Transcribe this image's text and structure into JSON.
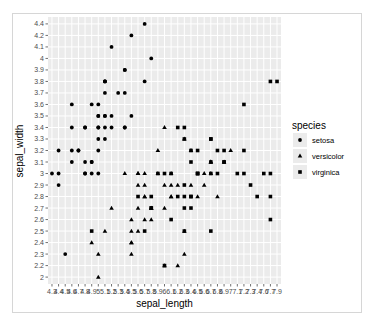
{
  "chart_data": {
    "type": "scatter",
    "title": "",
    "xlabel": "sepal_length",
    "ylabel": "sepal_width",
    "x_scale": "discrete",
    "y_scale": "discrete",
    "x_levels": [
      "4.3",
      "4.4",
      "4.5",
      "4.6",
      "4.7",
      "4.8",
      "4.9",
      "5",
      "5.1",
      "5.2",
      "5.3",
      "5.4",
      "5.5",
      "5.6",
      "5.7",
      "5.8",
      "5.9",
      "6",
      "6.1",
      "6.2",
      "6.3",
      "6.4",
      "6.5",
      "6.6",
      "6.7",
      "6.8",
      "6.9",
      "7",
      "7.1",
      "7.2",
      "7.3",
      "7.4",
      "7.6",
      "7.7",
      "7.9"
    ],
    "y_levels": [
      "2",
      "2.2",
      "2.3",
      "2.4",
      "2.5",
      "2.6",
      "2.7",
      "2.8",
      "2.9",
      "3",
      "3.1",
      "3.2",
      "3.3",
      "3.4",
      "3.5",
      "3.6",
      "3.7",
      "3.8",
      "3.9",
      "4",
      "4.1",
      "4.2",
      "4.4"
    ],
    "grid": true,
    "legend": {
      "title": "species",
      "position": "right",
      "entries": [
        {
          "label": "setosa",
          "shape": "circle"
        },
        {
          "label": "versicolor",
          "shape": "triangle"
        },
        {
          "label": "virginica",
          "shape": "square"
        }
      ]
    },
    "series": [
      {
        "name": "setosa",
        "shape": "circle",
        "x": [
          5.1,
          4.9,
          4.7,
          4.6,
          5,
          5.4,
          4.6,
          5,
          4.4,
          4.9,
          5.4,
          4.8,
          4.8,
          4.3,
          5.8,
          5.7,
          5.4,
          5.1,
          5.7,
          5.1,
          5.4,
          5.1,
          4.6,
          5.1,
          4.8,
          5,
          5,
          5.2,
          5.2,
          4.7,
          4.8,
          5.4,
          5.2,
          5.5,
          4.9,
          5,
          5.5,
          4.9,
          4.4,
          5.1,
          5,
          4.5,
          4.4,
          5,
          5.1,
          4.8,
          5.1,
          4.6,
          5.3,
          5
        ],
        "y": [
          3.5,
          3,
          3.2,
          3.1,
          3.6,
          3.9,
          3.4,
          3.4,
          2.9,
          3.1,
          3.7,
          3.4,
          3,
          3,
          4,
          4.4,
          3.9,
          3.5,
          3.8,
          3.8,
          3.4,
          3.7,
          3.6,
          3.3,
          3.4,
          3,
          3.4,
          3.5,
          3.4,
          3.2,
          3.1,
          3.4,
          4.1,
          4.2,
          3.1,
          3.2,
          3.5,
          3.6,
          3,
          3.4,
          3.5,
          2.3,
          3.2,
          3.5,
          3.8,
          3,
          3.8,
          3.2,
          3.7,
          3.3
        ]
      },
      {
        "name": "versicolor",
        "shape": "triangle",
        "x": [
          7,
          6.4,
          6.9,
          5.5,
          6.5,
          5.7,
          6.3,
          4.9,
          6.6,
          5.2,
          5,
          5.9,
          6,
          6.1,
          5.6,
          6.7,
          5.6,
          5.8,
          6.2,
          5.6,
          5.9,
          6.1,
          6.3,
          6.1,
          6.4,
          6.6,
          6.8,
          6.7,
          6,
          5.7,
          5.5,
          5.5,
          5.8,
          6,
          5.4,
          6,
          6.7,
          6.3,
          5.6,
          5.5,
          5.5,
          6.1,
          5.8,
          5,
          5.6,
          5.7,
          5.7,
          6.2,
          5.1,
          5.7
        ],
        "y": [
          3.2,
          3.2,
          3.1,
          2.3,
          2.8,
          2.8,
          3.3,
          2.4,
          2.9,
          2.7,
          2,
          3,
          2.2,
          2.9,
          2.9,
          3.1,
          3,
          2.7,
          2.2,
          2.5,
          3.2,
          2.8,
          2.5,
          2.8,
          2.9,
          3,
          2.8,
          3,
          2.9,
          2.6,
          2.4,
          2.4,
          2.7,
          2.7,
          3,
          3.4,
          3.1,
          2.3,
          3,
          2.5,
          2.6,
          3,
          2.6,
          2.3,
          2.7,
          3,
          2.9,
          2.9,
          2.5,
          2.8
        ]
      },
      {
        "name": "virginica",
        "shape": "square",
        "x": [
          6.3,
          5.8,
          7.1,
          6.3,
          6.5,
          7.6,
          4.9,
          7.3,
          6.7,
          7.2,
          6.5,
          6.4,
          6.8,
          5.7,
          5.8,
          6.4,
          6.5,
          7.7,
          7.7,
          6,
          6.9,
          5.6,
          7.7,
          6.3,
          6.7,
          7.2,
          6.2,
          6.1,
          6.4,
          7.2,
          7.4,
          7.9,
          6.4,
          6.3,
          6.1,
          7.7,
          6.3,
          6.4,
          6,
          6.9,
          6.7,
          6.9,
          5.8,
          6.8,
          6.7,
          6.7,
          6.3,
          6.5,
          6.2,
          5.9
        ],
        "y": [
          3.3,
          2.7,
          3,
          2.9,
          3,
          3,
          2.5,
          2.9,
          2.5,
          3.6,
          3.2,
          2.7,
          3,
          2.5,
          2.8,
          3.2,
          3,
          3.8,
          2.6,
          2.2,
          3.2,
          2.8,
          2.8,
          2.7,
          3.3,
          3.2,
          2.8,
          3,
          2.8,
          3,
          2.8,
          3.8,
          2.8,
          2.8,
          2.6,
          3,
          3.4,
          3.1,
          3,
          3.1,
          3.1,
          3.1,
          2.7,
          3.2,
          3.3,
          3,
          2.5,
          3,
          3.4,
          3
        ]
      }
    ]
  },
  "axes": {
    "x_title": "sepal_length",
    "y_title": "sepal_width"
  },
  "legend": {
    "title": "species",
    "items": [
      "setosa",
      "versicolor",
      "virginica"
    ]
  },
  "colors": {
    "panel_bg": "#ebebeb",
    "grid": "#ffffff",
    "point": "#000000",
    "tick_text": "#4d4d4d",
    "frame_border": "#d6d6d6"
  }
}
